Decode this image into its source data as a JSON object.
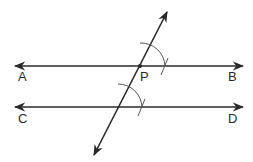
{
  "diagram": {
    "type": "geometry-construction",
    "labels": {
      "A": "A",
      "B": "B",
      "C": "C",
      "D": "D",
      "P": "P"
    },
    "colors": {
      "stroke": "#2a2a2a",
      "arc": "#555555",
      "background": "#ffffff"
    }
  }
}
